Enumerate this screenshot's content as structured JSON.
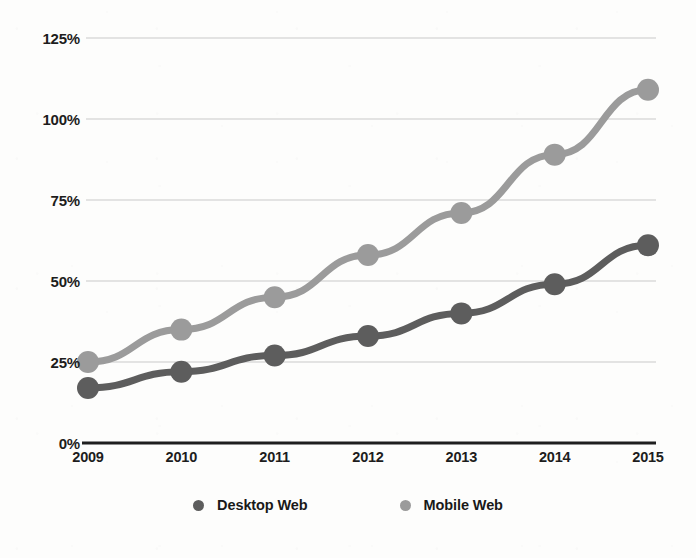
{
  "chart_data": {
    "type": "line",
    "title": "",
    "xlabel": "",
    "ylabel": "",
    "categories": [
      "2009",
      "2010",
      "2011",
      "2012",
      "2013",
      "2014",
      "2015"
    ],
    "x": [
      2009,
      2010,
      2011,
      2012,
      2013,
      2014,
      2015
    ],
    "series": [
      {
        "name": "Desktop Web",
        "color": "#5d5d5d",
        "values": [
          17,
          22,
          27,
          33,
          40,
          49,
          61
        ]
      },
      {
        "name": "Mobile Web",
        "color": "#9b9b9b",
        "values": [
          25,
          35,
          45,
          58,
          71,
          89,
          109
        ]
      }
    ],
    "ylim": [
      0,
      125
    ],
    "ytick_labels": [
      "125%",
      "100%",
      "75%",
      "50%",
      "25%",
      "0%"
    ],
    "ytick_values": [
      125,
      100,
      75,
      50,
      25,
      0
    ],
    "grid": true,
    "grid_axis": "y",
    "legend_position": "bottom",
    "markers": true,
    "marker_shape": "circle"
  },
  "axes": {
    "baseline_color": "#1f1f1f",
    "gridline_color": "#c9c9c9"
  },
  "legend": {
    "items": [
      {
        "label": "Desktop Web",
        "marker": "legend-dot-desktop",
        "color": "#5d5d5d"
      },
      {
        "label": "Mobile Web",
        "marker": "legend-dot-mobile",
        "color": "#9b9b9b"
      }
    ]
  }
}
